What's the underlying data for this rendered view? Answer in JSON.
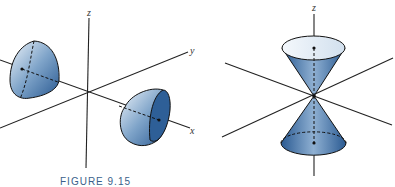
{
  "figure": {
    "caption": "FIGURE 9.15",
    "left_panel": {
      "axes": {
        "z": "z",
        "y": "y",
        "x": "x"
      },
      "description": "hyperboloid of two sheets along x-axis"
    },
    "right_panel": {
      "axes": {
        "z": "z"
      },
      "description": "double cone along z-axis"
    },
    "colors": {
      "surface_dark": "#2e5f97",
      "surface_light": "#e8f0f8",
      "axis": "#222222"
    }
  }
}
